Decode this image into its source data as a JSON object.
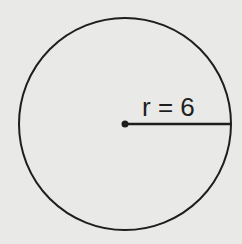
{
  "diagram": {
    "type": "circle",
    "radius_label": "r = 6",
    "radius_value": 6,
    "shape": {
      "cx": 125,
      "cy": 124,
      "r": 106
    },
    "colors": {
      "background": "#e9e9e7",
      "stroke": "#1e1e1e"
    }
  }
}
